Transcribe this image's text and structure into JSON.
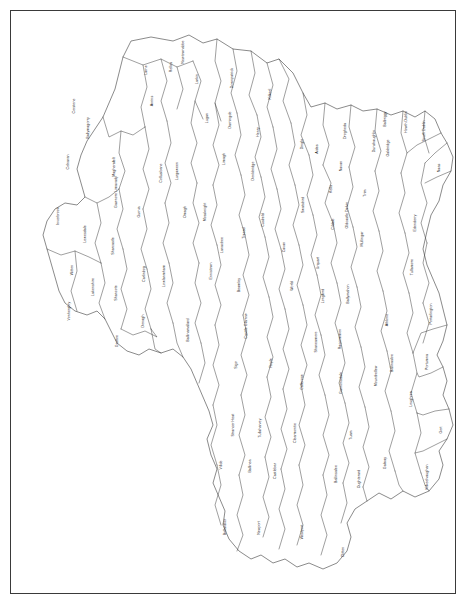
{
  "map": {
    "title": "Regional boundary map",
    "frame_color": "#3a3a3a",
    "outline_color": "#2b2b2b",
    "fill_color": "#ffffff",
    "label_color": "#1a1a1a",
    "width": 468,
    "height": 606,
    "regions": [
      {
        "name": "Inverbrook",
        "x": 58,
        "y": 215,
        "rot": true
      },
      {
        "name": "Corstone",
        "x": 74,
        "y": 105,
        "rot": true
      },
      {
        "name": "Colnaran",
        "x": 68,
        "y": 161,
        "rot": true
      },
      {
        "name": "Lewesdale",
        "x": 85,
        "y": 233,
        "rot": true
      },
      {
        "name": "Witton",
        "x": 72,
        "y": 269,
        "rot": true
      },
      {
        "name": "Vonherghry",
        "x": 69,
        "y": 310,
        "rot": true
      },
      {
        "name": "Lakenshire",
        "x": 93,
        "y": 286,
        "rot": true
      },
      {
        "name": "Sharcastle",
        "x": 113,
        "y": 245,
        "rot": true
      },
      {
        "name": "Shancote",
        "x": 116,
        "y": 292,
        "rot": true
      },
      {
        "name": "Gruttoe",
        "x": 117,
        "y": 340,
        "rot": true
      },
      {
        "name": "Ballymagorry",
        "x": 88,
        "y": 127,
        "rot": true
      },
      {
        "name": "Magherafelt",
        "x": 114,
        "y": 166,
        "rot": true
      },
      {
        "name": "Gawnore Limavady",
        "x": 116,
        "y": 191,
        "rot": true
      },
      {
        "name": "Gurnia",
        "x": 139,
        "y": 211,
        "rot": true
      },
      {
        "name": "Carlinbog",
        "x": 144,
        "y": 273,
        "rot": true
      },
      {
        "name": "Donagh",
        "x": 143,
        "y": 320,
        "rot": true
      },
      {
        "name": "Ballinamallard",
        "x": 188,
        "y": 329,
        "rot": true
      },
      {
        "name": "Lowlanmham",
        "x": 164,
        "y": 275,
        "rot": true
      },
      {
        "name": "Collusibane",
        "x": 161,
        "y": 172,
        "rot": true
      },
      {
        "name": "Anrins",
        "x": 152,
        "y": 100,
        "rot": true
      },
      {
        "name": "Larne",
        "x": 146,
        "y": 69,
        "rot": true
      },
      {
        "name": "Relles",
        "x": 171,
        "y": 66,
        "rot": true
      },
      {
        "name": "Newtownabbe",
        "x": 183,
        "y": 51,
        "rot": true
      },
      {
        "name": "Larkin",
        "x": 197,
        "y": 78,
        "rot": true
      },
      {
        "name": "Lugan",
        "x": 207,
        "y": 117,
        "rot": true
      },
      {
        "name": "Lurgaween",
        "x": 177,
        "y": 170,
        "rot": true
      },
      {
        "name": "Omagh",
        "x": 185,
        "y": 211,
        "rot": true
      },
      {
        "name": "Ennistown",
        "x": 211,
        "y": 270,
        "rot": true
      },
      {
        "name": "Lanacbee",
        "x": 222,
        "y": 244,
        "rot": true
      },
      {
        "name": "Mossknight",
        "x": 205,
        "y": 211,
        "rot": true
      },
      {
        "name": "Limagh",
        "x": 224,
        "y": 158,
        "rot": true
      },
      {
        "name": "Darningde",
        "x": 230,
        "y": 119,
        "rot": true
      },
      {
        "name": "Downpatrick",
        "x": 232,
        "y": 77,
        "rot": true
      },
      {
        "name": "Kilkeel",
        "x": 270,
        "y": 93,
        "rot": true
      },
      {
        "name": "Henry",
        "x": 258,
        "y": 131,
        "rot": true
      },
      {
        "name": "Donkbridge",
        "x": 253,
        "y": 170,
        "rot": true
      },
      {
        "name": "Cusbeld",
        "x": 263,
        "y": 219,
        "rot": true
      },
      {
        "name": "Tressd",
        "x": 244,
        "y": 232,
        "rot": true
      },
      {
        "name": "Beamley",
        "x": 239,
        "y": 284,
        "rot": true
      },
      {
        "name": "Casttle Glarrow",
        "x": 246,
        "y": 325,
        "rot": true
      },
      {
        "name": "Sigo",
        "x": 236,
        "y": 364,
        "rot": true
      },
      {
        "name": "Strancer Heat",
        "x": 233,
        "y": 424,
        "rot": true
      },
      {
        "name": "Villde",
        "x": 221,
        "y": 464,
        "rot": true
      },
      {
        "name": "Bellardlier",
        "x": 225,
        "y": 526,
        "rot": true
      },
      {
        "name": "Tullaharvey",
        "x": 260,
        "y": 427,
        "rot": true
      },
      {
        "name": "Ballinea",
        "x": 250,
        "y": 465,
        "rot": true
      },
      {
        "name": "Newport",
        "x": 259,
        "y": 527,
        "rot": true
      },
      {
        "name": "Castlebar",
        "x": 275,
        "y": 470,
        "rot": true
      },
      {
        "name": "Royle",
        "x": 271,
        "y": 362,
        "rot": true
      },
      {
        "name": "World",
        "x": 292,
        "y": 285,
        "rot": true
      },
      {
        "name": "Cavan",
        "x": 284,
        "y": 246,
        "rot": true
      },
      {
        "name": "Swatsbird",
        "x": 303,
        "y": 204,
        "rot": true
      },
      {
        "name": "Dingle",
        "x": 302,
        "y": 143,
        "rot": true
      },
      {
        "name": "Aides",
        "x": 317,
        "y": 148,
        "rot": true
      },
      {
        "name": "Kells",
        "x": 331,
        "y": 188,
        "rot": true
      },
      {
        "name": "Cildale",
        "x": 333,
        "y": 223,
        "rot": true
      },
      {
        "name": "Urquart",
        "x": 318,
        "y": 262,
        "rot": true
      },
      {
        "name": "Longford",
        "x": 323,
        "y": 295,
        "rot": true
      },
      {
        "name": "Shaneamore",
        "x": 316,
        "y": 341,
        "rot": true
      },
      {
        "name": "Callerose",
        "x": 302,
        "y": 381,
        "rot": true
      },
      {
        "name": "Clearmontie",
        "x": 295,
        "y": 432,
        "rot": true
      },
      {
        "name": "Westport",
        "x": 302,
        "y": 531,
        "rot": true
      },
      {
        "name": "Clitten",
        "x": 343,
        "y": 551,
        "rot": true
      },
      {
        "name": "Tuam",
        "x": 351,
        "y": 434,
        "rot": true
      },
      {
        "name": "Ballinsalee",
        "x": 336,
        "y": 473,
        "rot": true
      },
      {
        "name": "Gannonsdale",
        "x": 341,
        "y": 382,
        "rot": true
      },
      {
        "name": "Raccommon",
        "x": 340,
        "y": 338,
        "rot": true
      },
      {
        "name": "Ballymahon",
        "x": 348,
        "y": 293,
        "rot": true
      },
      {
        "name": "Mullingar",
        "x": 362,
        "y": 238,
        "rot": true
      },
      {
        "name": "Oldcastle Delvin",
        "x": 347,
        "y": 214,
        "rot": true
      },
      {
        "name": "Trim",
        "x": 365,
        "y": 192,
        "rot": true
      },
      {
        "name": "Navan",
        "x": 341,
        "y": 165,
        "rot": true
      },
      {
        "name": "Dunshaughlin",
        "x": 374,
        "y": 140,
        "rot": true
      },
      {
        "name": "Drogheda",
        "x": 345,
        "y": 130,
        "rot": true
      },
      {
        "name": "Oakbridge",
        "x": 388,
        "y": 147,
        "rot": true
      },
      {
        "name": "Balbriggy",
        "x": 385,
        "y": 118,
        "rot": true
      },
      {
        "name": "Howth Dublin",
        "x": 406,
        "y": 121,
        "rot": true
      },
      {
        "name": "South Dublin",
        "x": 424,
        "y": 130,
        "rot": true
      },
      {
        "name": "Naas",
        "x": 439,
        "y": 167,
        "rot": true
      },
      {
        "name": "Edenderry",
        "x": 415,
        "y": 222,
        "rot": true
      },
      {
        "name": "Tullamore",
        "x": 412,
        "y": 266,
        "rot": true
      },
      {
        "name": "Portarlington",
        "x": 431,
        "y": 313,
        "rot": true
      },
      {
        "name": "Athlone",
        "x": 387,
        "y": 319,
        "rot": true
      },
      {
        "name": "Mountbellew",
        "x": 376,
        "y": 375,
        "rot": true
      },
      {
        "name": "Ballinasloe",
        "x": 392,
        "y": 362,
        "rot": true
      },
      {
        "name": "Portumna",
        "x": 427,
        "y": 361,
        "rot": true
      },
      {
        "name": "Loughrea",
        "x": 411,
        "y": 398,
        "rot": true
      },
      {
        "name": "Gort",
        "x": 441,
        "y": 429,
        "rot": true
      },
      {
        "name": "Galway",
        "x": 385,
        "y": 462,
        "rot": true
      },
      {
        "name": "Oughterard",
        "x": 359,
        "y": 478,
        "rot": true
      },
      {
        "name": "Kilkeelvaughan",
        "x": 427,
        "y": 476,
        "rot": true
      }
    ]
  }
}
